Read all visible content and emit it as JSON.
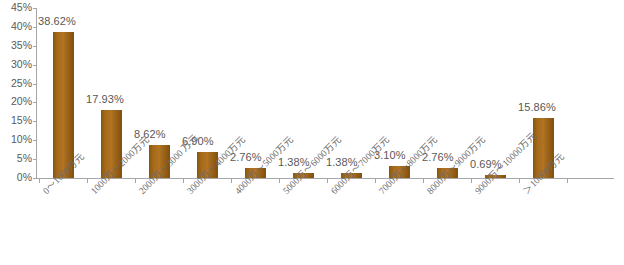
{
  "chart_data": {
    "type": "bar",
    "title": "",
    "xlabel": "",
    "ylabel": "",
    "ylim": [
      0,
      45
    ],
    "ytick_step": 5,
    "grid": false,
    "legend": null,
    "bar_color": "#9a6218",
    "axis_color": "#a6a6a6",
    "label_color": "#585858",
    "categories": [
      "0～1000万元",
      "1000万～2000万元",
      "2000万～3000 万元",
      "3000万～4000万元",
      "4000万～5000万元",
      "5000万～6000万元",
      "6000万～7000万元",
      "7000万～8000万元",
      "8000万～9000万元",
      "9000万～10000万元",
      "＞10000万元"
    ],
    "values": [
      38.62,
      17.93,
      8.62,
      6.9,
      2.76,
      1.38,
      1.38,
      3.1,
      2.76,
      0.69,
      15.86
    ],
    "value_labels": [
      "38.62%",
      "17.93%",
      "8.62%",
      "6.90%",
      "2.76%",
      "1.38%",
      "1.38%",
      "3.10%",
      "2.76%",
      "0.69%",
      "15.86%"
    ],
    "ytick_labels": [
      "0%",
      "5%",
      "10%",
      "15%",
      "20%",
      "25%",
      "30%",
      "35%",
      "40%",
      "45%"
    ]
  }
}
